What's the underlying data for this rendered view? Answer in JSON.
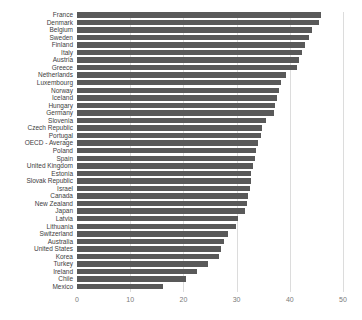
{
  "chart_data": {
    "type": "bar",
    "orientation": "horizontal",
    "title": "",
    "xlabel": "",
    "ylabel": "",
    "legend": "none",
    "grid": "vertical",
    "xlim": [
      0,
      52
    ],
    "xticks": [
      0,
      10,
      20,
      30,
      40,
      50
    ],
    "categories": [
      "France",
      "Denmark",
      "Belgium",
      "Sweden",
      "Finland",
      "Italy",
      "Austria",
      "Greece",
      "Netherlands",
      "Luxembourg",
      "Norway",
      "Iceland",
      "Hungary",
      "Germany",
      "Slovenia",
      "Czech Republic",
      "Portugal",
      "OECD - Average",
      "Poland",
      "Spain",
      "United Kingdom",
      "Estonia",
      "Slovak Republic",
      "Israel",
      "Canada",
      "New Zealand",
      "Japan",
      "Latvia",
      "Lithuania",
      "Switzerland",
      "Australia",
      "United States",
      "Korea",
      "Turkey",
      "Ireland",
      "Chile",
      "Mexico"
    ],
    "values": [
      45.8,
      45.5,
      44.1,
      43.7,
      42.8,
      42.3,
      41.8,
      41.4,
      39.2,
      38.3,
      37.9,
      37.5,
      37.3,
      37.1,
      35.6,
      34.7,
      34.5,
      34.0,
      33.6,
      33.4,
      33.1,
      32.8,
      32.7,
      32.5,
      32.2,
      31.9,
      31.5,
      30.2,
      29.9,
      28.4,
      27.6,
      27.0,
      26.7,
      24.7,
      22.6,
      20.4,
      16.1
    ],
    "bar_color": "#595959",
    "gridline_color": "#dcdcdc",
    "category_label_color": "#3d3d3d",
    "tick_label_color": "#7a7a7a",
    "background_color": "#ffffff"
  }
}
